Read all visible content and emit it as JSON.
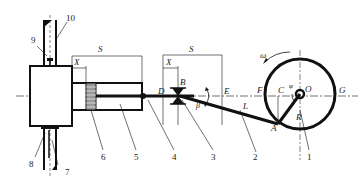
{
  "diagram": {
    "type": "crank-slider mechanism schematic",
    "part_numbers": [
      "1",
      "2",
      "3",
      "4",
      "5",
      "6",
      "7",
      "8",
      "9",
      "10"
    ],
    "points": {
      "A": "A",
      "B": "B",
      "C": "C",
      "D": "D",
      "E": "E",
      "F": "F",
      "G": "G",
      "O": "O"
    },
    "dimensions": {
      "stroke_left": "S",
      "offset_left": "X",
      "stroke_right": "S",
      "offset_right": "X",
      "rod_length": "L",
      "crank_radius": "R",
      "crank_angle": "φ",
      "rod_angle": "β",
      "angular_velocity": "ω"
    }
  }
}
